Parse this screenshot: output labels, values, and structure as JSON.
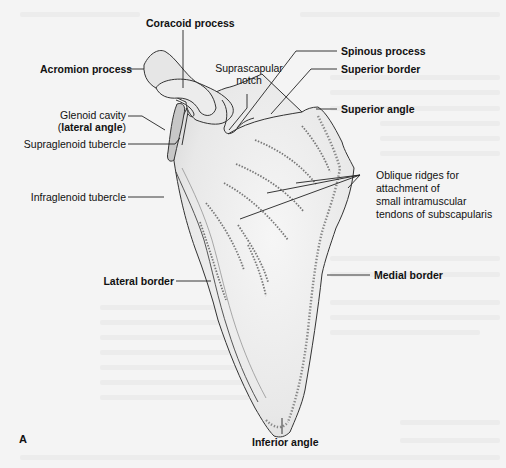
{
  "figure": {
    "panel_letter": "A",
    "colors": {
      "background": "#f4f4f4",
      "bone_fill": "#e9e9e9",
      "bone_outline": "#333333",
      "glenoid_fill": "#c9c9c9",
      "leader_line": "#222222",
      "label_text": "#111111"
    }
  },
  "labels": {
    "coracoid_process": "Coracoid process",
    "acromion_process": "Acromion process",
    "suprascapular_notch_line1": "Suprascapular",
    "suprascapular_notch_line2": "notch",
    "glenoid_cavity": "Glenoid cavity",
    "lateral_angle_open": "(",
    "lateral_angle": "lateral angle",
    "lateral_angle_close": ")",
    "supraglenoid_tubercle": "Supraglenoid tubercle",
    "infraglenoid_tubercle": "Infraglenoid tubercle",
    "spinous_process": "Spinous process",
    "superior_border": "Superior border",
    "superior_angle": "Superior angle",
    "oblique_ridges_line1": "Oblique ridges for",
    "oblique_ridges_line2": "attachment of",
    "oblique_ridges_line3": "small intramuscular",
    "oblique_ridges_line4": "tendons of subscapularis",
    "lateral_border": "Lateral border",
    "medial_border": "Medial border",
    "inferior_angle": "Inferior angle"
  }
}
